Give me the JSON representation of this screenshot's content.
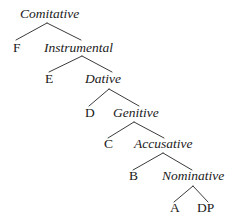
{
  "diagram": {
    "type": "syntax-tree",
    "background_color": "#ffffff",
    "line_color": "#3b3b3b",
    "text_color": "#1a1a1a",
    "nodes": [
      {
        "id": "comitative",
        "label": "Comitative",
        "style": "phrase",
        "x": 20,
        "y": 18,
        "anchor": "left"
      },
      {
        "id": "f",
        "label": "F",
        "style": "head",
        "x": 13,
        "y": 52,
        "anchor": "left"
      },
      {
        "id": "instrumental",
        "label": "Instrumental",
        "style": "phrase",
        "x": 44,
        "y": 52,
        "anchor": "left"
      },
      {
        "id": "e",
        "label": "E",
        "style": "head",
        "x": 45,
        "y": 83,
        "anchor": "left"
      },
      {
        "id": "dative",
        "label": "Dative",
        "style": "phrase",
        "x": 85,
        "y": 83,
        "anchor": "left"
      },
      {
        "id": "d",
        "label": "D",
        "style": "head",
        "x": 85,
        "y": 117,
        "anchor": "left"
      },
      {
        "id": "genitive",
        "label": "Genitive",
        "style": "phrase",
        "x": 113,
        "y": 117,
        "anchor": "left"
      },
      {
        "id": "c",
        "label": "C",
        "style": "head",
        "x": 104,
        "y": 148,
        "anchor": "left"
      },
      {
        "id": "accusative",
        "label": "Accusative",
        "style": "phrase",
        "x": 134,
        "y": 148,
        "anchor": "left"
      },
      {
        "id": "b",
        "label": "B",
        "style": "head",
        "x": 129,
        "y": 180,
        "anchor": "left"
      },
      {
        "id": "nominative",
        "label": "Nominative",
        "style": "phrase",
        "x": 162,
        "y": 180,
        "anchor": "left"
      },
      {
        "id": "a",
        "label": "A",
        "style": "head",
        "x": 170,
        "y": 212,
        "anchor": "left"
      },
      {
        "id": "dp",
        "label": "DP",
        "style": "head",
        "x": 197,
        "y": 212,
        "anchor": "left"
      }
    ],
    "branches": [
      {
        "id": "comitative-to-f",
        "parent": "comitative",
        "child": "f",
        "x1": 47,
        "y1": 23,
        "x2": 16,
        "y2": 40
      },
      {
        "id": "comitative-to-instrumental",
        "parent": "comitative",
        "child": "instrumental",
        "x1": 47,
        "y1": 23,
        "x2": 81,
        "y2": 40
      },
      {
        "id": "instrumental-to-e",
        "parent": "instrumental",
        "child": "e",
        "x1": 82,
        "y1": 56,
        "x2": 49,
        "y2": 72
      },
      {
        "id": "instrumental-to-dative",
        "parent": "instrumental",
        "child": "dative",
        "x1": 82,
        "y1": 56,
        "x2": 112,
        "y2": 72
      },
      {
        "id": "dative-to-d",
        "parent": "dative",
        "child": "d",
        "x1": 109,
        "y1": 89,
        "x2": 89,
        "y2": 106
      },
      {
        "id": "dative-to-genitive",
        "parent": "dative",
        "child": "genitive",
        "x1": 109,
        "y1": 89,
        "x2": 139,
        "y2": 106
      },
      {
        "id": "genitive-to-c",
        "parent": "genitive",
        "child": "c",
        "x1": 134,
        "y1": 122,
        "x2": 108,
        "y2": 138
      },
      {
        "id": "genitive-to-accusative",
        "parent": "genitive",
        "child": "accusative",
        "x1": 134,
        "y1": 122,
        "x2": 164,
        "y2": 138
      },
      {
        "id": "accusative-to-b",
        "parent": "accusative",
        "child": "b",
        "x1": 163,
        "y1": 153,
        "x2": 133,
        "y2": 170
      },
      {
        "id": "accusative-to-nominative",
        "parent": "accusative",
        "child": "nominative",
        "x1": 163,
        "y1": 153,
        "x2": 192,
        "y2": 170
      },
      {
        "id": "nominative-to-a",
        "parent": "nominative",
        "child": "a",
        "x1": 193,
        "y1": 186,
        "x2": 174,
        "y2": 202
      },
      {
        "id": "nominative-to-dp",
        "parent": "nominative",
        "child": "dp",
        "x1": 193,
        "y1": 186,
        "x2": 208,
        "y2": 202
      }
    ]
  }
}
